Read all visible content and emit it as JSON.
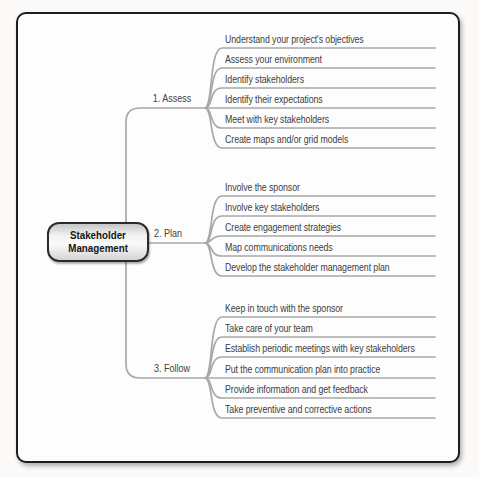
{
  "diagram": {
    "center": {
      "line1": "Stakeholder",
      "line2": "Management"
    },
    "branches": [
      {
        "label": "1. Assess",
        "items": [
          "Understand your project's objectives",
          "Assess your environment",
          "Identify stakeholders",
          "Identify their expectations",
          "Meet with key stakeholders",
          "Create maps and/or grid models"
        ]
      },
      {
        "label": "2. Plan",
        "items": [
          "Involve the sponsor",
          "Involve key stakeholders",
          "Create engagement strategies",
          "Map communications needs",
          "Develop the stakeholder management plan"
        ]
      },
      {
        "label": "3. Follow",
        "items": [
          "Keep in touch with the sponsor",
          "Take care of your team",
          "Establish periodic meetings with key stakeholders",
          "Put the communication plan into practice",
          "Provide information and get feedback",
          "Take preventive and corrective actions"
        ]
      }
    ],
    "colors": {
      "frame_border": "#1d1d1d",
      "connector_line": "#a8a8a8",
      "item_text": "#3d3d3d",
      "node_border": "#2a2a2a",
      "node_fill_light": "#fafafa",
      "node_fill_dark": "#c7c7c7"
    }
  }
}
